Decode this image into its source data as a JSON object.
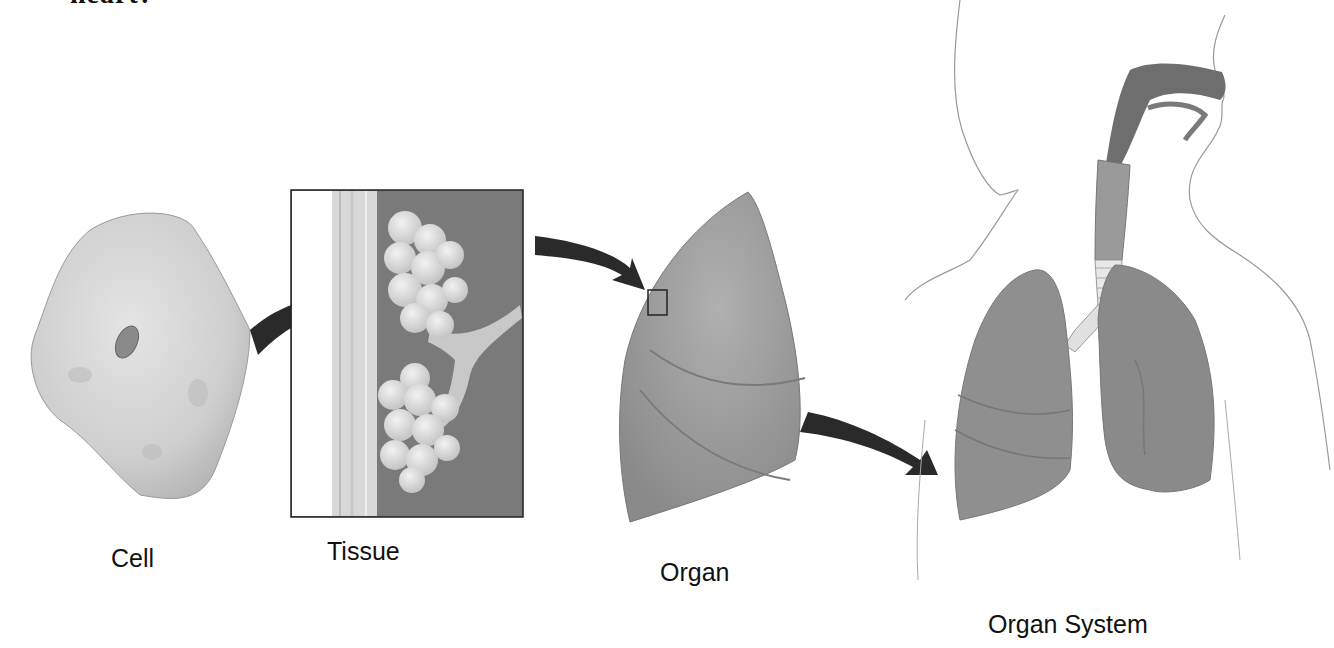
{
  "heading": {
    "cropped_text": "heart?"
  },
  "labels": {
    "cell": "Cell",
    "tissue": "Tissue",
    "organ": "Organ",
    "organ_system": "Organ System"
  },
  "stages": [
    {
      "name": "cell",
      "icon": "cell-icon"
    },
    {
      "name": "tissue",
      "icon": "alveoli-tissue-icon"
    },
    {
      "name": "organ",
      "icon": "lung-icon"
    },
    {
      "name": "organ_system",
      "icon": "respiratory-system-icon"
    }
  ],
  "colors": {
    "background": "#ffffff",
    "arrow": "#2a2a2a",
    "cell_fill": "#d2d2d2",
    "tissue_bg": "#7a7a7a",
    "lung_fill": "#9a9a9a",
    "text": "#111111"
  }
}
